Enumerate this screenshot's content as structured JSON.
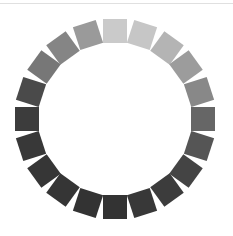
{
  "spinner": {
    "label": "Loading spinner",
    "center": [
      115,
      119
    ],
    "radius": 88,
    "segment_size": 24,
    "segment_count": 20,
    "step_degrees": 18,
    "segment_colors": [
      "#cacaca",
      "#c6c6c6",
      "#b4b4b4",
      "#9c9c9c",
      "#888888",
      "#666666",
      "#555555",
      "#444444",
      "#3c3c3c",
      "#383838",
      "#333333",
      "#333333",
      "#353535",
      "#363636",
      "#383838",
      "#3c3c3c",
      "#4a4a4a",
      "#777777",
      "#858585",
      "#9a9a9a"
    ]
  },
  "divider": {
    "color": "#e0e0e0"
  }
}
